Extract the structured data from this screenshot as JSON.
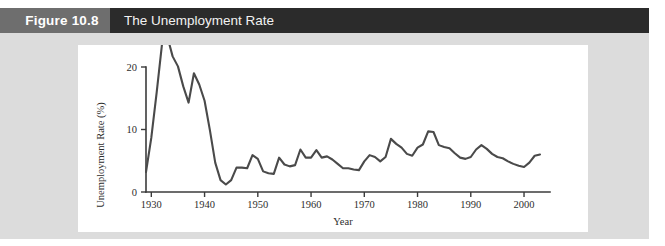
{
  "header": {
    "figure_number": "Figure 10.8",
    "figure_title": "The Unemployment Rate",
    "number_block_color": "#6e6e6e",
    "bar_color": "#2b2b2b",
    "text_color": "#ffffff"
  },
  "panel": {
    "background": "#ffffff",
    "body_background": "#dcdcdc"
  },
  "chart_data": {
    "type": "line",
    "title": "The Unemployment Rate",
    "xlabel": "Year",
    "ylabel": "Unemployment Rate (%)",
    "xlim": [
      1929,
      2003
    ],
    "ylim": [
      0,
      20
    ],
    "xticks": [
      1930,
      1940,
      1950,
      1960,
      1970,
      1980,
      1990,
      2000
    ],
    "xticklabels": [
      "1930",
      "1940",
      "1950",
      "1960",
      "1970",
      "1980",
      "1990",
      "2000"
    ],
    "yticks": [
      0,
      10,
      20
    ],
    "yticklabels": [
      "0",
      "10",
      "20"
    ],
    "grid": false,
    "legend": "none",
    "line_color": "#4a4a4a",
    "series": [
      {
        "name": "Unemployment Rate (%)",
        "x": [
          1929,
          1930,
          1931,
          1932,
          1933,
          1934,
          1935,
          1936,
          1937,
          1938,
          1939,
          1940,
          1941,
          1942,
          1943,
          1944,
          1945,
          1946,
          1947,
          1948,
          1949,
          1950,
          1951,
          1952,
          1953,
          1954,
          1955,
          1956,
          1957,
          1958,
          1959,
          1960,
          1961,
          1962,
          1963,
          1964,
          1965,
          1966,
          1967,
          1968,
          1969,
          1970,
          1971,
          1972,
          1973,
          1974,
          1975,
          1976,
          1977,
          1978,
          1979,
          1980,
          1981,
          1982,
          1983,
          1984,
          1985,
          1986,
          1987,
          1988,
          1989,
          1990,
          1991,
          1992,
          1993,
          1994,
          1995,
          1996,
          1997,
          1998,
          1999,
          2000,
          2001,
          2002,
          2003
        ],
        "values": [
          3.2,
          8.7,
          15.9,
          23.6,
          24.9,
          21.7,
          20.1,
          16.9,
          14.3,
          19.0,
          17.2,
          14.6,
          9.9,
          4.7,
          1.9,
          1.2,
          1.9,
          3.9,
          3.9,
          3.8,
          5.9,
          5.3,
          3.3,
          3.0,
          2.9,
          5.5,
          4.4,
          4.1,
          4.3,
          6.8,
          5.5,
          5.5,
          6.7,
          5.5,
          5.7,
          5.2,
          4.5,
          3.8,
          3.8,
          3.6,
          3.5,
          4.9,
          5.9,
          5.6,
          4.9,
          5.6,
          8.5,
          7.7,
          7.1,
          6.1,
          5.8,
          7.1,
          7.6,
          9.7,
          9.6,
          7.5,
          7.2,
          7.0,
          6.2,
          5.5,
          5.3,
          5.6,
          6.8,
          7.5,
          6.9,
          6.1,
          5.6,
          5.4,
          4.9,
          4.5,
          4.2,
          4.0,
          4.7,
          5.8,
          6.0
        ]
      }
    ]
  }
}
